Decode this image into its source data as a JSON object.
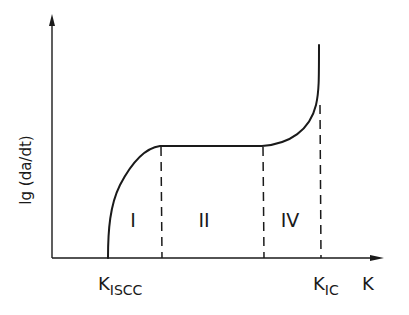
{
  "figure": {
    "y_axis_label": "lg (da/dt)",
    "x_axis_label": "K",
    "x_markers": [
      {
        "main": "K",
        "sub": "ISCC"
      },
      {
        "main": "K",
        "sub": "IC"
      }
    ],
    "regions": [
      "I",
      "II",
      "IV"
    ],
    "colors": {
      "ink": "#1a1a1a",
      "background": "#ffffff"
    }
  }
}
